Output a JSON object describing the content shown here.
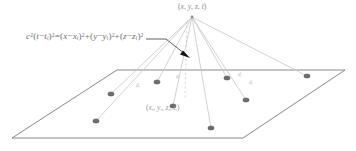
{
  "figure": {
    "background_color": "#ffffff",
    "line_color": "#8c8c8c",
    "plane_edge_color": "#7a7a7a",
    "ray_color": "#c9c9c9",
    "dot_color": "#6e6e6e",
    "text_color": "#7c7c7c",
    "arrow_color": "#1a1a1a"
  },
  "equation": {
    "text": "c²(t−t i)²=(x−x i)²+(y−y i)²+(z−z i)²",
    "lhs_coeff": "c",
    "lhs_exp": "2",
    "parts": {
      "c": "c",
      "two": "2",
      "t": "t",
      "ti": "i",
      "x": "x",
      "xi": "i",
      "y": "y",
      "yi": "i",
      "z": "z",
      "zi": "i"
    }
  },
  "labels": {
    "apex": "(x, y, z, t)",
    "station": "(x i, y i, z i, t i)",
    "apex_parts": {
      "x": "x",
      "y": "y",
      "z": "z",
      "t": "t"
    },
    "station_parts": {
      "x": "x",
      "y": "y",
      "z": "z",
      "t": "t",
      "sub": "i"
    },
    "distance_label": "d",
    "distance_sub": "i"
  },
  "geometry": {
    "plane_corners": [
      {
        "name": "top-left",
        "x": 117,
        "y": 70
      },
      {
        "name": "top-right",
        "x": 345,
        "y": 70
      },
      {
        "name": "bottom-right",
        "x": 243,
        "y": 138
      },
      {
        "name": "bottom-left",
        "x": 12,
        "y": 138
      }
    ],
    "apex": {
      "x": 192,
      "y": 17
    },
    "foot": {
      "x": 185,
      "y": 96
    },
    "stations": [
      {
        "id": 1,
        "x": 111,
        "y": 94,
        "labelled": false
      },
      {
        "id": 2,
        "x": 96,
        "y": 121,
        "labelled": false
      },
      {
        "id": 3,
        "x": 157,
        "y": 82,
        "labelled": false
      },
      {
        "id": 4,
        "x": 173,
        "y": 106,
        "labelled": true
      },
      {
        "id": 5,
        "x": 211,
        "y": 128,
        "labelled": false
      },
      {
        "id": 6,
        "x": 227,
        "y": 78,
        "labelled": false
      },
      {
        "id": 7,
        "x": 246,
        "y": 100,
        "labelled": false
      },
      {
        "id": 8,
        "x": 307,
        "y": 76,
        "labelled": false
      }
    ],
    "ray_distance_labels": [
      {
        "for_station": 1,
        "x": 136,
        "y": 86
      },
      {
        "for_station": 3,
        "x": 176,
        "y": 77
      },
      {
        "for_station": 6,
        "x": 238,
        "y": 75
      },
      {
        "for_station": 7,
        "x": 249,
        "y": 83
      }
    ],
    "leader": {
      "from": {
        "x": 146,
        "y": 39
      },
      "elbow": {
        "x": 166,
        "y": 39
      },
      "to": {
        "x": 188,
        "y": 56
      }
    },
    "vertical_dashed": {
      "from_y": 22,
      "to_y": 98,
      "x": 187
    }
  }
}
